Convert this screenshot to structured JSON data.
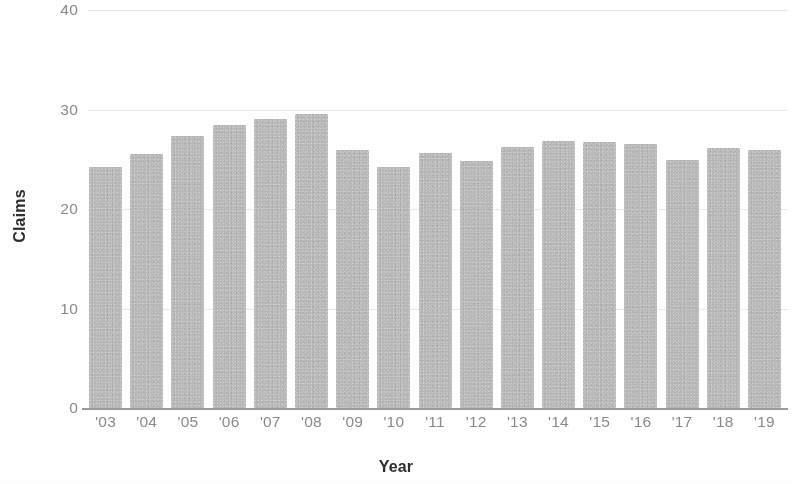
{
  "chart_data": {
    "type": "bar",
    "title": "",
    "xlabel": "Year",
    "ylabel": "Claims",
    "categories": [
      "'03",
      "'04",
      "'05",
      "'06",
      "'07",
      "'08",
      "'09",
      "'10",
      "'11",
      "'12",
      "'13",
      "'14",
      "'15",
      "'16",
      "'17",
      "'18",
      "'19"
    ],
    "values": [
      24.2,
      25.5,
      27.3,
      28.4,
      29.0,
      29.5,
      25.9,
      24.2,
      25.6,
      24.8,
      26.2,
      26.8,
      26.7,
      26.5,
      24.9,
      26.1,
      25.9
    ],
    "series": [
      {
        "name": "Claims",
        "values": [
          24.2,
          25.5,
          27.3,
          28.4,
          29.0,
          29.5,
          25.9,
          24.2,
          25.6,
          24.8,
          26.2,
          26.8,
          26.7,
          26.5,
          24.9,
          26.1,
          25.9
        ]
      }
    ],
    "ylim": [
      0,
      40
    ],
    "ytick_labels": [
      "0",
      "10",
      "20",
      "30",
      "40"
    ],
    "ytick_values": [
      0,
      10,
      20,
      30,
      40
    ],
    "grid": true,
    "grid_axis": "y",
    "legend": false,
    "legend_position": "none",
    "bar_color": "#b9b9b9",
    "gridline_color": "#e9e9ec",
    "axis_color": "#9b9b9b",
    "tick_label_color": "#8a8a8a",
    "axis_title_color": "#2e2e2e",
    "background_color": "#ffffff"
  }
}
